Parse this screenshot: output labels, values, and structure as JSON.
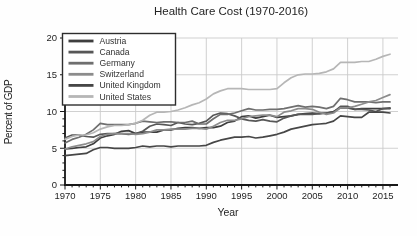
{
  "chart_data": {
    "type": "line",
    "title": "Health Care Cost (1970-2016)",
    "xlabel": "Year",
    "ylabel": "Percent of GDP",
    "xlim": [
      1970,
      2016
    ],
    "ylim": [
      0,
      20
    ],
    "xticks": [
      1970,
      1975,
      1980,
      1985,
      1990,
      1995,
      2000,
      2005,
      2010,
      2015
    ],
    "yticks": [
      0,
      5,
      10,
      15,
      20
    ],
    "grid": true,
    "grid_color": "#c9c9c9",
    "axis_color": "#1a1a1a",
    "legend_position": "upper left",
    "legend_border_color": "#2f2f2f",
    "legend_background": "#fdfdfd",
    "x": [
      1970,
      1971,
      1972,
      1973,
      1974,
      1975,
      1976,
      1977,
      1978,
      1979,
      1980,
      1981,
      1982,
      1983,
      1984,
      1985,
      1986,
      1987,
      1988,
      1989,
      1990,
      1991,
      1992,
      1993,
      1994,
      1995,
      1996,
      1997,
      1998,
      1999,
      2000,
      2001,
      2002,
      2003,
      2004,
      2005,
      2006,
      2007,
      2008,
      2009,
      2010,
      2011,
      2012,
      2013,
      2014,
      2015,
      2016
    ],
    "series": [
      {
        "name": "Austria",
        "color": "#3f3f3f",
        "values": [
          4.9,
          5.0,
          5.1,
          5.2,
          5.6,
          6.4,
          6.7,
          6.9,
          7.3,
          7.4,
          7.0,
          7.2,
          7.2,
          7.2,
          7.5,
          7.5,
          7.7,
          7.8,
          7.8,
          7.7,
          7.8,
          7.8,
          8.0,
          8.5,
          8.7,
          9.3,
          9.4,
          9.1,
          9.3,
          9.5,
          9.2,
          9.3,
          9.4,
          9.6,
          9.7,
          9.8,
          9.7,
          9.8,
          10.0,
          10.5,
          10.5,
          10.3,
          10.4,
          10.4,
          10.4,
          10.4,
          10.4
        ]
      },
      {
        "name": "Canada",
        "color": "#585858",
        "values": [
          6.4,
          6.8,
          6.8,
          6.6,
          6.5,
          6.9,
          7.0,
          7.0,
          7.0,
          6.9,
          7.0,
          7.3,
          8.0,
          8.3,
          8.2,
          8.1,
          8.5,
          8.3,
          8.2,
          8.4,
          8.7,
          9.5,
          9.8,
          9.7,
          9.4,
          9.0,
          8.8,
          8.7,
          8.9,
          8.7,
          8.6,
          9.1,
          9.4,
          9.6,
          9.6,
          9.6,
          9.7,
          9.8,
          9.9,
          10.7,
          10.7,
          10.3,
          10.3,
          10.2,
          10.0,
          10.4,
          10.5
        ]
      },
      {
        "name": "Germany",
        "color": "#6f6f6f",
        "values": [
          5.7,
          6.2,
          6.5,
          6.9,
          7.5,
          8.4,
          8.2,
          8.2,
          8.2,
          8.2,
          8.4,
          8.7,
          8.6,
          8.5,
          8.6,
          8.6,
          8.5,
          8.5,
          8.7,
          8.3,
          8.3,
          9.0,
          9.6,
          9.6,
          9.8,
          10.1,
          10.4,
          10.2,
          10.2,
          10.3,
          10.3,
          10.4,
          10.6,
          10.8,
          10.6,
          10.7,
          10.6,
          10.4,
          10.7,
          11.8,
          11.6,
          11.3,
          11.3,
          11.3,
          11.2,
          11.3,
          11.3
        ]
      },
      {
        "name": "Switzerland",
        "color": "#8c8c8c",
        "values": [
          4.9,
          5.2,
          5.4,
          5.6,
          5.9,
          6.6,
          6.9,
          7.0,
          7.0,
          7.0,
          6.9,
          7.0,
          7.2,
          7.5,
          7.5,
          7.6,
          7.6,
          7.6,
          7.7,
          7.7,
          7.6,
          8.0,
          8.5,
          8.8,
          8.8,
          9.0,
          9.3,
          9.4,
          9.5,
          9.5,
          9.3,
          9.9,
          10.1,
          10.4,
          10.4,
          10.3,
          9.9,
          9.6,
          9.8,
          10.5,
          10.5,
          10.7,
          11.0,
          11.3,
          11.5,
          11.9,
          12.3
        ]
      },
      {
        "name": "United Kingdom",
        "color": "#474747",
        "values": [
          4.0,
          4.1,
          4.2,
          4.3,
          4.8,
          5.1,
          5.1,
          5.0,
          5.0,
          5.0,
          5.1,
          5.3,
          5.2,
          5.3,
          5.3,
          5.2,
          5.3,
          5.3,
          5.3,
          5.3,
          5.4,
          5.8,
          6.1,
          6.3,
          6.5,
          6.5,
          6.6,
          6.4,
          6.5,
          6.7,
          6.9,
          7.2,
          7.6,
          7.8,
          8.0,
          8.2,
          8.3,
          8.4,
          8.7,
          9.4,
          9.3,
          9.2,
          9.2,
          9.9,
          9.9,
          9.9,
          9.8
        ]
      },
      {
        "name": "United States",
        "color": "#b5b5b5",
        "values": [
          6.2,
          6.6,
          6.8,
          6.8,
          7.1,
          7.6,
          7.9,
          8.1,
          8.1,
          8.2,
          8.4,
          8.8,
          9.5,
          9.9,
          9.9,
          10.0,
          10.2,
          10.5,
          10.9,
          11.2,
          11.7,
          12.4,
          12.8,
          13.1,
          13.1,
          13.1,
          13.0,
          13.0,
          13.0,
          13.0,
          13.1,
          13.9,
          14.6,
          15.0,
          15.1,
          15.1,
          15.2,
          15.4,
          15.8,
          16.7,
          16.7,
          16.7,
          16.8,
          16.8,
          17.1,
          17.5,
          17.8
        ]
      }
    ]
  }
}
